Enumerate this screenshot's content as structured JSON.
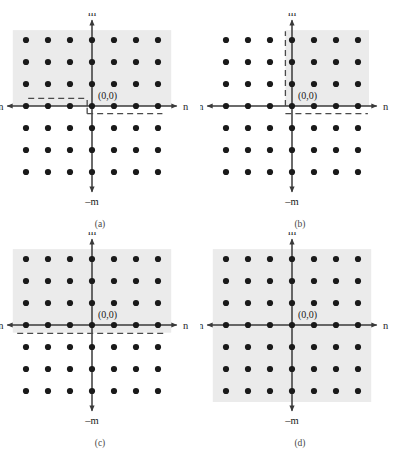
{
  "running_head": "ALGORITHM FOR 2-D FIR FILTER DESIGN",
  "figure": {
    "axis_labels": {
      "m_positive": "m",
      "m_negative": "–m",
      "n_positive": "n",
      "n_negative": "–n"
    },
    "origin_label": "(0,0)",
    "colors": {
      "dot": "#1a1a1a",
      "axis": "#3a3a3a",
      "shading": "#ebebeb",
      "dashed": "#4a4a4a",
      "background": "#ffffff",
      "caption": "#4a4a4a"
    },
    "lattice": {
      "type": "square-grid",
      "columns": 7,
      "rows": 7,
      "n_values": [
        -3,
        -2,
        -1,
        0,
        1,
        2,
        3
      ],
      "m_values": [
        3,
        2,
        1,
        0,
        -1,
        -2,
        -3
      ],
      "spacing_px": 22,
      "dot_radius_px": 3.1
    },
    "panels": [
      {
        "id": "a",
        "caption": "(a)",
        "region_description": "upper half-plane shaded with offset step boundary at origin",
        "shaded_regions": [
          {
            "n_from": -3.6,
            "n_to": 3.6,
            "m_from": 0.0,
            "m_to": 3.45
          }
        ],
        "dashed_segments": [
          {
            "orientation": "horizontal",
            "m": 0.35,
            "n_from": -2.9,
            "n_to": -0.22
          },
          {
            "orientation": "vertical",
            "n": -0.22,
            "m_from": 0.0,
            "m_to": 0.35
          },
          {
            "orientation": "vertical",
            "n": -0.22,
            "m_from": -0.35,
            "m_to": 0.0
          },
          {
            "orientation": "horizontal",
            "m": -0.35,
            "n_from": -0.22,
            "n_to": 3.2
          }
        ]
      },
      {
        "id": "b",
        "caption": "(b)",
        "region_description": "upper-right quadrant shaded, bounded by vertical and horizontal dashed lines",
        "shaded_regions": [
          {
            "n_from": -0.3,
            "n_to": 3.5,
            "m_from": 0.0,
            "m_to": 3.45
          }
        ],
        "dashed_segments": [
          {
            "orientation": "vertical",
            "n": -0.3,
            "m_from": 0.0,
            "m_to": 3.4
          },
          {
            "orientation": "horizontal",
            "m": -0.35,
            "n_from": -0.3,
            "n_to": 3.45
          }
        ]
      },
      {
        "id": "c",
        "caption": "(c)",
        "region_description": "full upper half-plane shaded, single horizontal dashed boundary below axis",
        "shaded_regions": [
          {
            "n_from": -3.6,
            "n_to": 3.6,
            "m_from": -0.35,
            "m_to": 3.45
          }
        ],
        "dashed_segments": [
          {
            "orientation": "horizontal",
            "m": -0.38,
            "n_from": -3.4,
            "n_to": 3.3
          }
        ]
      },
      {
        "id": "d",
        "caption": "(d)",
        "region_description": "entire plane shaded, no dashed boundaries",
        "shaded_regions": [
          {
            "n_from": -3.6,
            "n_to": 3.6,
            "m_from": -3.5,
            "m_to": 3.45
          }
        ],
        "dashed_segments": []
      }
    ]
  }
}
